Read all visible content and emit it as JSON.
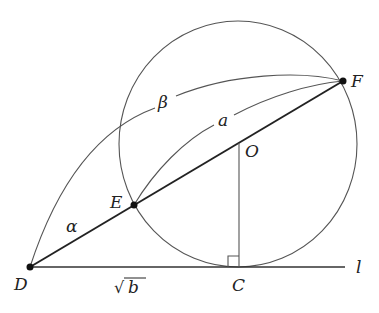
{
  "diagram": {
    "points": {
      "D": {
        "label": "D",
        "x": 30,
        "y": 267
      },
      "E": {
        "label": "E",
        "x": 134,
        "y": 205
      },
      "F": {
        "label": "F",
        "x": 343,
        "y": 81
      },
      "O": {
        "label": "O",
        "x": 239,
        "y": 143
      },
      "C": {
        "label": "C",
        "x": 239,
        "y": 267
      }
    },
    "line_label": "l",
    "labels": {
      "alpha": "α",
      "beta": "β",
      "a": "a",
      "sqrt_b_radical": "√",
      "sqrt_b_var": "b"
    },
    "circle": {
      "cx": 238,
      "cy": 144,
      "r": 122
    },
    "segments": [
      "DF",
      "DC",
      "OC",
      "line l"
    ],
    "arcs": [
      "β: D→F",
      "a: E→F"
    ],
    "right_angle_at": "C"
  }
}
